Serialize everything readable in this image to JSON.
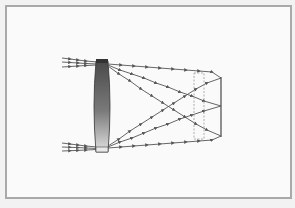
{
  "diagram": {
    "type": "ray-optics",
    "colors": {
      "background": "#fafafa",
      "frame": "#a9a9a9",
      "ray": "#555555",
      "lens_dark": "#4a4a4a",
      "lens_light": "#dcdcdc",
      "screen": "#555555",
      "dashed_box": "#999999"
    },
    "lens": {
      "label": "converging-lens"
    },
    "screen": {
      "label": "screen"
    },
    "aperture": {
      "label": "dashed-aperture-box"
    },
    "ray_bundles": [
      {
        "name": "top-bundle",
        "count": 3
      },
      {
        "name": "bottom-bundle",
        "count": 3
      }
    ]
  }
}
